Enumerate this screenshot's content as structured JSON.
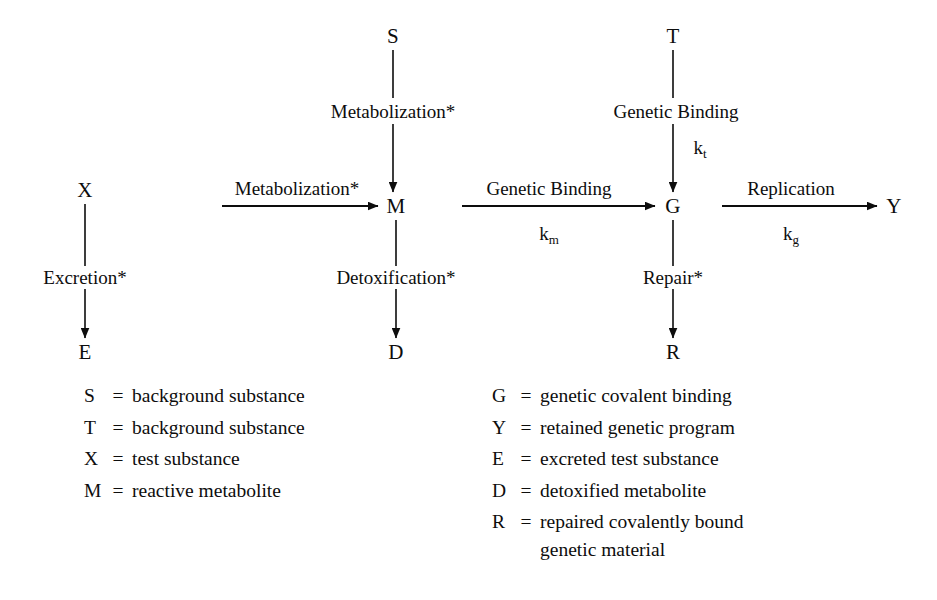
{
  "diagram": {
    "nodes": [
      {
        "id": "S",
        "label": "S",
        "x": 393,
        "y": 36
      },
      {
        "id": "T",
        "label": "T",
        "x": 673,
        "y": 36
      },
      {
        "id": "X",
        "label": "X",
        "x": 85,
        "y": 190
      },
      {
        "id": "M",
        "label": "M",
        "x": 396,
        "y": 206
      },
      {
        "id": "G",
        "label": "G",
        "x": 673,
        "y": 206
      },
      {
        "id": "Y",
        "label": "Y",
        "x": 894,
        "y": 206
      },
      {
        "id": "E",
        "label": "E",
        "x": 85,
        "y": 352
      },
      {
        "id": "D",
        "label": "D",
        "x": 396,
        "y": 352
      },
      {
        "id": "R",
        "label": "R",
        "x": 673,
        "y": 352
      }
    ],
    "edge_labels": [
      {
        "id": "s-to-m",
        "text": "Metabolization*",
        "x": 393,
        "y": 111
      },
      {
        "id": "t-to-g",
        "text": "Genetic Binding",
        "x": 676,
        "y": 111
      },
      {
        "id": "x-to-m",
        "text": "Metabolization*",
        "x": 297,
        "y": 188
      },
      {
        "id": "m-to-g",
        "text": "Genetic Binding",
        "x": 549,
        "y": 188
      },
      {
        "id": "g-to-y",
        "text": "Replication",
        "x": 791,
        "y": 188
      },
      {
        "id": "x-to-e",
        "text": "Excretion*",
        "x": 85,
        "y": 277
      },
      {
        "id": "m-to-d",
        "text": "Detoxification*",
        "x": 396,
        "y": 277
      },
      {
        "id": "g-to-r",
        "text": "Repair*",
        "x": 673,
        "y": 277
      }
    ],
    "rate_constants": [
      {
        "id": "k-t",
        "symbol": "k",
        "subscript": "t",
        "x": 700,
        "y": 147
      },
      {
        "id": "k-m",
        "symbol": "k",
        "subscript": "m",
        "x": 549,
        "y": 233
      },
      {
        "id": "k-g",
        "symbol": "k",
        "subscript": "g",
        "x": 791,
        "y": 233
      }
    ]
  },
  "legend": {
    "equals": "=",
    "left_column": [
      {
        "symbol": "S",
        "description": "background substance"
      },
      {
        "symbol": "T",
        "description": "background substance"
      },
      {
        "symbol": "X",
        "description": "test substance"
      },
      {
        "symbol": "M",
        "description": "reactive metabolite"
      }
    ],
    "right_column": [
      {
        "symbol": "G",
        "description": "genetic covalent binding",
        "continuation": ""
      },
      {
        "symbol": "Y",
        "description": "retained genetic program",
        "continuation": ""
      },
      {
        "symbol": "E",
        "description": "excreted test substance",
        "continuation": ""
      },
      {
        "symbol": "D",
        "description": "detoxified metabolite",
        "continuation": ""
      },
      {
        "symbol": "R",
        "description": "repaired covalently bound",
        "continuation": "genetic material"
      }
    ]
  },
  "colors": {
    "ink": "#0d0d0d",
    "background": "#ffffff"
  }
}
